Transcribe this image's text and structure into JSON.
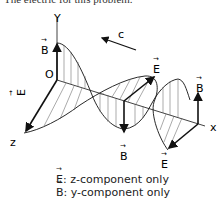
{
  "header": {
    "text": "The electric for this problem."
  },
  "diagram": {
    "axes": {
      "y": "Y",
      "z": "z",
      "x": "x",
      "origin": "O"
    },
    "wave_direction_label": "c",
    "vectors": {
      "b_at_origin": "B",
      "e_at_origin": "E",
      "e_mid_top": "E",
      "b_mid_bottom": "B",
      "b_right_top": "B",
      "e_right_bottom": "E"
    }
  },
  "caption": {
    "line1_symbol": "E",
    "line1_text": ": z-component only",
    "line2_symbol": "B",
    "line2_text": ": y-component only"
  }
}
